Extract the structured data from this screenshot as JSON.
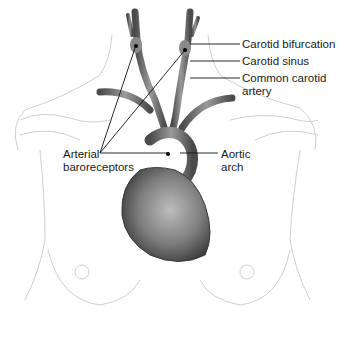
{
  "figure": {
    "labels": {
      "carotid_bifurcation": "Carotid bifurcation",
      "carotid_sinus": "Carotid sinus",
      "common_carotid_line1": "Common carotid",
      "common_carotid_line2": "artery",
      "arterial_line1": "Arterial",
      "arterial_line2": "baroreceptors",
      "aortic_line1": "Aortic",
      "aortic_line2": "arch"
    },
    "colors": {
      "vessel": "#6e6e6e",
      "heart": "#7a7a7a",
      "outline": "#c8c8c8",
      "leader": "#111111"
    }
  }
}
